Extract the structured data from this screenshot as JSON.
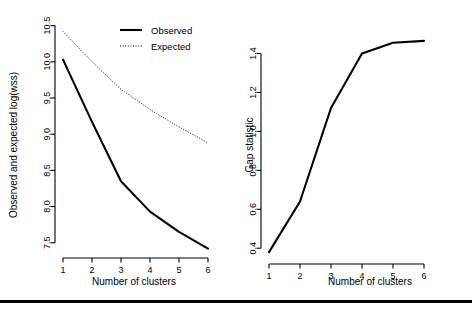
{
  "figure": {
    "footer_rule": "horizontal-rule"
  },
  "panels": [
    {
      "id": "gap-left-panel",
      "ylabel": "Observed and expected log(wss)",
      "xlabel": "Number of clusters",
      "xticks": [
        "1",
        "2",
        "3",
        "4",
        "5",
        "6"
      ],
      "yticks": [
        "7.5",
        "8.0",
        "8.5",
        "9.0",
        "9.5",
        "10.0",
        "10.5"
      ],
      "legend": [
        {
          "label": "Observed",
          "style": "solid"
        },
        {
          "label": "Expected",
          "style": "dotted"
        }
      ]
    },
    {
      "id": "gap-right-panel",
      "ylabel": "Gap statistic",
      "xlabel": "Number of clusters",
      "xticks": [
        "1",
        "2",
        "3",
        "4",
        "5",
        "6"
      ],
      "yticks": [
        "0.4",
        "0.6",
        "0.8",
        "1.0",
        "1.2",
        "1.4"
      ]
    }
  ],
  "chart_data": [
    {
      "type": "line",
      "title": "",
      "xlabel": "Number of clusters",
      "ylabel": "Observed and expected log(wss)",
      "x": [
        1,
        2,
        3,
        4,
        5,
        6
      ],
      "xlim": [
        1,
        6
      ],
      "ylim": [
        7.4,
        10.55
      ],
      "xticks": [
        1,
        2,
        3,
        4,
        5,
        6
      ],
      "yticks": [
        7.5,
        8.0,
        8.5,
        9.0,
        9.5,
        10.0,
        10.5
      ],
      "grid": false,
      "legend_position": "top-right",
      "series": [
        {
          "name": "Observed",
          "style": "solid",
          "color": "#000000",
          "values": [
            10.03,
            9.17,
            8.35,
            7.93,
            7.65,
            7.42
          ]
        },
        {
          "name": "Expected",
          "style": "dotted",
          "color": "#000000",
          "values": [
            10.42,
            10.0,
            9.62,
            9.34,
            9.1,
            8.88
          ]
        }
      ]
    },
    {
      "type": "line",
      "title": "",
      "xlabel": "Number of clusters",
      "ylabel": "Gap statistic",
      "x": [
        1,
        2,
        3,
        4,
        5,
        6
      ],
      "xlim": [
        1,
        6
      ],
      "ylim": [
        0.36,
        1.49
      ],
      "xticks": [
        1,
        2,
        3,
        4,
        5,
        6
      ],
      "yticks": [
        0.4,
        0.6,
        0.8,
        1.0,
        1.2,
        1.4
      ],
      "grid": false,
      "legend_position": "none",
      "series": [
        {
          "name": "Gap statistic",
          "style": "solid",
          "color": "#000000",
          "values": [
            0.38,
            0.64,
            1.12,
            1.4,
            1.455,
            1.465
          ]
        }
      ]
    }
  ]
}
